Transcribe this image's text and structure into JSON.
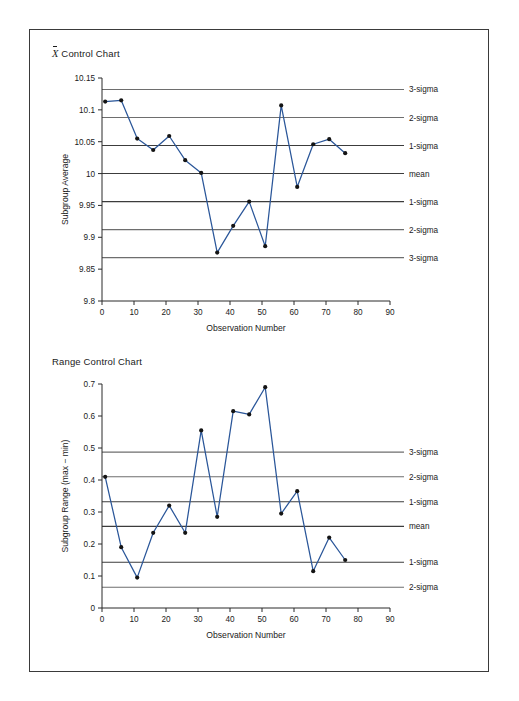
{
  "figure": {
    "border_color": "#3a3a3a",
    "background": "#ffffff"
  },
  "charts": [
    {
      "id": "xbar",
      "title_prefix": "X",
      "title": " Control Chart",
      "title_full": "X̄ Control Chart",
      "ylabel": "Subgroup Average",
      "xlabel": "Observation Number"
    },
    {
      "id": "range",
      "title": "Range Control Chart",
      "ylabel": "Subgroup Range (max − min)",
      "xlabel": "Observation Number"
    }
  ],
  "chart_data": [
    {
      "type": "line",
      "id": "xbar-control-chart",
      "title": "X̄ Control Chart",
      "xlabel": "Observation Number",
      "ylabel": "Subgroup Average",
      "xlim": [
        0,
        90
      ],
      "ylim": [
        9.8,
        10.15
      ],
      "xticks": [
        0,
        10,
        20,
        30,
        40,
        50,
        60,
        70,
        80,
        90
      ],
      "yticks": [
        9.8,
        9.85,
        9.9,
        9.95,
        10,
        10.05,
        10.1,
        10.15
      ],
      "grid": false,
      "legend_position": "right-outside",
      "x": [
        1,
        6,
        11,
        16,
        21,
        26,
        31,
        36,
        41,
        46,
        51,
        56,
        61,
        66,
        71,
        76
      ],
      "values": [
        10.113,
        10.115,
        10.055,
        10.037,
        10.059,
        10.021,
        10.001,
        9.876,
        9.918,
        9.956,
        9.886,
        10.107,
        9.979,
        10.046,
        10.054,
        10.032
      ],
      "control_limits": [
        {
          "label": "3-sigma",
          "value": 10.132
        },
        {
          "label": "2-sigma",
          "value": 10.088
        },
        {
          "label": "1-sigma",
          "value": 10.044
        },
        {
          "label": "mean",
          "value": 10.0
        },
        {
          "label": "1-sigma",
          "value": 9.956
        },
        {
          "label": "2-sigma",
          "value": 9.912
        },
        {
          "label": "3-sigma",
          "value": 9.868
        }
      ]
    },
    {
      "type": "line",
      "id": "range-control-chart",
      "title": "Range Control Chart",
      "xlabel": "Observation Number",
      "ylabel": "Subgroup Range (max − min)",
      "xlim": [
        0,
        90
      ],
      "ylim": [
        0,
        0.7
      ],
      "xticks": [
        0,
        10,
        20,
        30,
        40,
        50,
        60,
        70,
        80,
        90
      ],
      "yticks": [
        0,
        0.1,
        0.2,
        0.3,
        0.4,
        0.5,
        0.6,
        0.7
      ],
      "grid": false,
      "legend_position": "right-outside",
      "x": [
        1,
        6,
        11,
        16,
        21,
        26,
        31,
        36,
        41,
        46,
        51,
        56,
        61,
        66,
        71,
        76
      ],
      "values": [
        0.41,
        0.19,
        0.095,
        0.235,
        0.32,
        0.235,
        0.555,
        0.285,
        0.615,
        0.605,
        0.69,
        0.295,
        0.365,
        0.115,
        0.22,
        0.15
      ],
      "control_limits": [
        {
          "label": "3-sigma",
          "value": 0.487
        },
        {
          "label": "2-sigma",
          "value": 0.41
        },
        {
          "label": "1-sigma",
          "value": 0.332
        },
        {
          "label": "mean",
          "value": 0.255
        },
        {
          "label": "1-sigma",
          "value": 0.143
        },
        {
          "label": "2-sigma",
          "value": 0.065
        }
      ]
    }
  ],
  "colors": {
    "series_line": "#2a5699",
    "marker": "#141414",
    "sigma_line": "#6e6e6e",
    "axis": "#2b2b2b"
  }
}
